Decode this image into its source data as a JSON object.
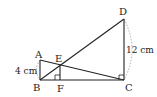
{
  "diagram": {
    "points": {
      "A": "A",
      "B": "B",
      "C": "C",
      "D": "D",
      "E": "E",
      "F": "F"
    },
    "measurements": {
      "AB": "4 cm",
      "DC": "12 cm"
    },
    "segments": [
      "AB",
      "BC",
      "CD",
      "AC",
      "BD",
      "EF"
    ],
    "right_angles": [
      "EFC",
      "DCB"
    ],
    "colors": {
      "line": "#222222",
      "dashed_arc": "#999999",
      "background": "#ffffff"
    }
  }
}
